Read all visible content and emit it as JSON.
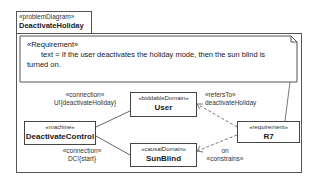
{
  "diagram": {
    "frame": {
      "stereotype": "«problemDiagram»",
      "name": "DeactivateHoliday"
    },
    "note": {
      "stereotype": "«Requirement»",
      "line1": "text = If the user deactivates the holiday mode, then the sun blind is",
      "line2": "turned on."
    },
    "nodes": {
      "user": {
        "stereotype": "«biddableDomain»",
        "name": "User"
      },
      "machine": {
        "stereotype": "«machine»",
        "name": "DeactivateControl"
      },
      "sunblind": {
        "stereotype": "«causalDomain»",
        "name": "SunBlind"
      },
      "requirement": {
        "stereotype": "«requirement»",
        "name": "R7"
      }
    },
    "edges": {
      "conn1": {
        "stereotype": "«connection»",
        "label": "U!{deactivateHoliday}"
      },
      "conn2": {
        "stereotype": "«connection»",
        "label": "DC!{start}"
      },
      "refers": {
        "stereotype": "«refersTo»",
        "label": "deactivateHoliday"
      },
      "constrains": {
        "label": "on",
        "stereotype": "«constrains»"
      }
    }
  }
}
